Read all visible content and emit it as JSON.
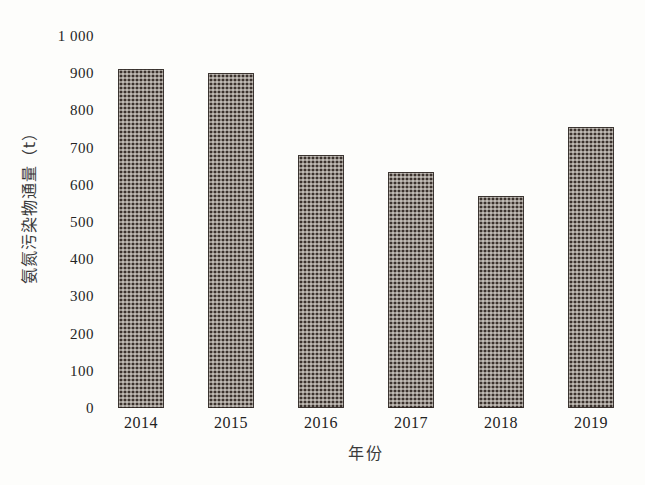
{
  "chart_data": {
    "type": "bar",
    "title": "",
    "subtitle": "",
    "xlabel": "年份",
    "ylabel": "氨氮污染物通量（t）",
    "categories": [
      "2014",
      "2015",
      "2016",
      "2017",
      "2018",
      "2019"
    ],
    "values": [
      910,
      900,
      680,
      635,
      570,
      755
    ],
    "series": [
      {
        "name": "氨氮污染物通量",
        "values": [
          910,
          900,
          680,
          635,
          570,
          755
        ]
      }
    ],
    "ylim": [
      0,
      1000
    ],
    "ytick_values": [
      0,
      100,
      200,
      300,
      400,
      500,
      600,
      700,
      800,
      900,
      1000
    ],
    "ytick_labels": [
      "0",
      "100",
      "200",
      "300",
      "400",
      "500",
      "600",
      "700",
      "800",
      "900",
      "1 000"
    ],
    "xtick_labels": [
      "2014",
      "2015",
      "2016",
      "2017",
      "2018",
      "2019"
    ],
    "grid": false,
    "legend": false,
    "legend_position": "none",
    "bar_color": "#3b322d",
    "bar_pattern": "checkered-dot-hatch",
    "background_color": "#fdfdfb",
    "annotations": []
  }
}
